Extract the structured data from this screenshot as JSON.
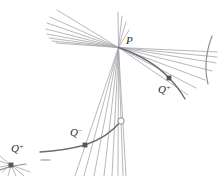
{
  "figure": {
    "background_color": "#ffffff",
    "width": 218,
    "height": 176,
    "colors": {
      "line_light": "#a8a8ad",
      "line_mid": "#8e8e95",
      "curve_dark": "#6b6b72",
      "marker_fill": "#55555c",
      "marker_open_stroke": "#8a8a92",
      "label_text": "#2b2b2b"
    },
    "labels": [
      {
        "id": "label-p",
        "base": "P",
        "superscript": "",
        "text": "P",
        "x": 126,
        "y": 44,
        "font_size": 11
      },
      {
        "id": "label-q-plus-right",
        "base": "Q",
        "superscript": "+",
        "text": "Q+",
        "x": 158,
        "y": 93,
        "font_size": 11
      },
      {
        "id": "label-q-minus",
        "base": "Q",
        "superscript": "−",
        "text": "Q−",
        "x": 70,
        "y": 136,
        "font_size": 11
      },
      {
        "id": "label-q-plus-left",
        "base": "Q",
        "superscript": "+",
        "text": "Q+",
        "x": 11,
        "y": 152,
        "font_size": 11
      }
    ],
    "points": [
      {
        "id": "point-p",
        "name": "P",
        "x": 118.5,
        "y": 47.5,
        "marker": "none"
      },
      {
        "id": "point-q-plus-right",
        "name": "Q+",
        "x": 169,
        "y": 78,
        "marker": "filled-square",
        "size": 4.2
      },
      {
        "id": "point-q-minus",
        "name": "Q-",
        "x": 85,
        "y": 145,
        "marker": "filled-square",
        "size": 4.2
      },
      {
        "id": "point-q-plus-left",
        "name": "Q+ (lower left)",
        "x": 11,
        "y": 165,
        "marker": "filled-square",
        "size": 4.2
      },
      {
        "id": "point-open-circle",
        "name": "open vertex",
        "x": 121,
        "y": 121,
        "marker": "open-circle",
        "size": 3.2
      }
    ],
    "pencil_upper_left": {
      "name": "pencil of lines through P toward upper left",
      "apex": [
        118.5,
        47.5
      ],
      "endpoints": [
        [
          57,
          10
        ],
        [
          50,
          17
        ],
        [
          47,
          23
        ],
        [
          46,
          29
        ],
        [
          47,
          34
        ],
        [
          49,
          38
        ],
        [
          52,
          41
        ],
        [
          56,
          43
        ]
      ]
    },
    "pencil_right": {
      "name": "pencil of lines through P toward the right",
      "apex": [
        118.5,
        47.5
      ],
      "endpoints": [
        [
          217,
          52
        ],
        [
          217,
          57
        ],
        [
          216,
          63
        ],
        [
          212,
          71
        ],
        [
          205,
          80
        ],
        [
          196,
          88
        ],
        [
          188,
          95
        ]
      ]
    },
    "pencil_down": {
      "name": "pencil of near-vertical lines through P descending",
      "apex": [
        118.5,
        47.5
      ],
      "endpoints": [
        [
          75,
          176
        ],
        [
          84,
          176
        ],
        [
          94,
          176
        ],
        [
          104,
          176
        ],
        [
          112,
          176
        ],
        [
          118,
          176
        ],
        [
          123,
          176
        ],
        [
          126,
          176
        ]
      ]
    },
    "pencil_up": {
      "name": "short pencil of lines above P",
      "apex": [
        118.5,
        47.5
      ],
      "endpoints": [
        [
          118,
          12
        ],
        [
          122,
          16
        ],
        [
          126,
          22
        ],
        [
          129,
          30
        ]
      ]
    },
    "pencil_lower_left": {
      "name": "small pencil of lines through lower-left Q+",
      "apex": [
        11,
        165
      ],
      "endpoints": [
        [
          0,
          156
        ],
        [
          0,
          161
        ],
        [
          0,
          167
        ],
        [
          2,
          172
        ],
        [
          8,
          176
        ],
        [
          16,
          176
        ],
        [
          24,
          176
        ],
        [
          30,
          172
        ]
      ]
    },
    "curves": [
      {
        "id": "curve-upper",
        "name": "upper envelope curve through P and Q+",
        "path": "M 118.5 47.5 C 140 55 158 66 169 78 C 176 85 181 92 185 99",
        "stroke": "#6b6b72",
        "width": 1.4
      },
      {
        "id": "curve-lower",
        "name": "lower envelope curve through Q- and open vertex",
        "path": "M 40 152 C 58 151 74 148 85 145 C 100 140 113 131 121 121",
        "stroke": "#6b6b72",
        "width": 1.4
      },
      {
        "id": "curve-right-edge",
        "name": "curve fragment at right edge",
        "path": "M 212 36 C 206 52 204 68 208 84",
        "stroke": "#8e8e95",
        "width": 1.2
      },
      {
        "id": "curve-lower-left-fragment",
        "name": "short curve fragment near lower-left Q+",
        "path": "M 0 170 C 8 167 16 165 26 164",
        "stroke": "#8e8e95",
        "width": 1.2
      }
    ],
    "dashes": [
      {
        "id": "dash-lower-left",
        "name": "short horizontal dash right of lower-left Q+",
        "x1": 41,
        "y1": 160,
        "x2": 50,
        "y2": 160,
        "stroke": "#8e8e95",
        "width": 1.1
      }
    ]
  }
}
